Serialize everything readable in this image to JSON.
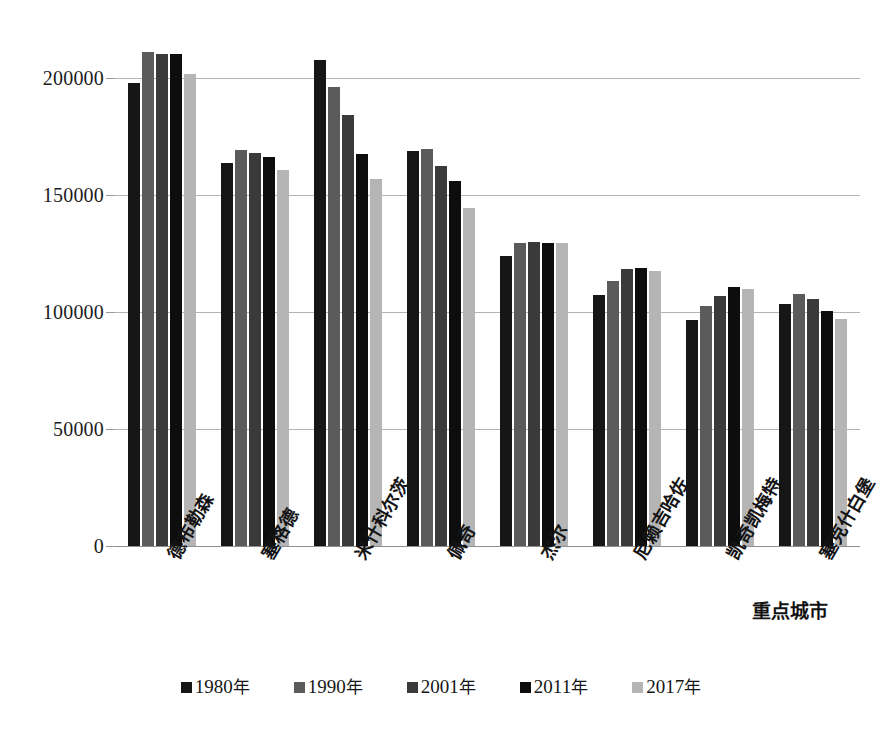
{
  "chart_data": {
    "type": "bar",
    "title": "",
    "xlabel": "重点城市",
    "ylabel": "",
    "ylim": [
      0,
      225000
    ],
    "yticks": [
      0,
      50000,
      100000,
      150000,
      200000
    ],
    "ytick_labels": [
      "0",
      "50000",
      "100000",
      "150000",
      "200000"
    ],
    "grid": true,
    "legend_position": "bottom",
    "categories": [
      "德布勒森",
      "塞格德",
      "米什科尔茨",
      "佩奇",
      "杰尔",
      "尼赖吉哈佐",
      "凯奇凯梅特",
      "塞克什白堡"
    ],
    "series": [
      {
        "name": "1980年",
        "color": "#161616",
        "values": [
          198000,
          164000,
          208000,
          169000,
          124000,
          107500,
          96500,
          103500
        ]
      },
      {
        "name": "1990年",
        "color": "#5b5b5b",
        "values": [
          211500,
          169500,
          196500,
          170000,
          129500,
          113500,
          102500,
          108000
        ]
      },
      {
        "name": "2001年",
        "color": "#3a3a3a",
        "values": [
          210500,
          168000,
          184500,
          162500,
          130000,
          118500,
          107000,
          105500
        ]
      },
      {
        "name": "2011年",
        "color": "#0d0d0d",
        "values": [
          210500,
          166500,
          167500,
          156000,
          129500,
          119000,
          111000,
          100500
        ]
      },
      {
        "name": "2017年",
        "color": "#b5b5b5",
        "values": [
          202000,
          161000,
          157000,
          144500,
          129500,
          117500,
          110000,
          97000
        ]
      }
    ]
  },
  "axis": {
    "x_title": "重点城市"
  },
  "legend": {
    "items": [
      {
        "label": "1980年",
        "swatch": "#161616"
      },
      {
        "label": "1990年",
        "swatch": "#5b5b5b"
      },
      {
        "label": "2001年",
        "swatch": "#3a3a3a"
      },
      {
        "label": "2011年",
        "swatch": "#0d0d0d"
      },
      {
        "label": "2017年",
        "swatch": "#b5b5b5"
      }
    ]
  }
}
